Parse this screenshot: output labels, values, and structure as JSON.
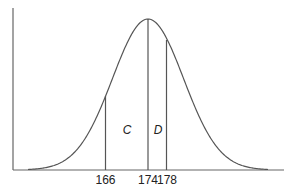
{
  "diagram": {
    "type": "normal-distribution-curve",
    "colors": {
      "line": "#555555",
      "text": "#222222",
      "background": "#ffffff"
    },
    "axis_ticks": [
      {
        "value": "166",
        "x": 105.5
      },
      {
        "value": "174",
        "x": 148
      },
      {
        "value": "178",
        "x": 166.5
      }
    ],
    "regions": [
      {
        "label": "C",
        "between": [
          "166",
          "174"
        ]
      },
      {
        "label": "D",
        "between": [
          "174",
          "178"
        ]
      }
    ],
    "mean": 174
  }
}
